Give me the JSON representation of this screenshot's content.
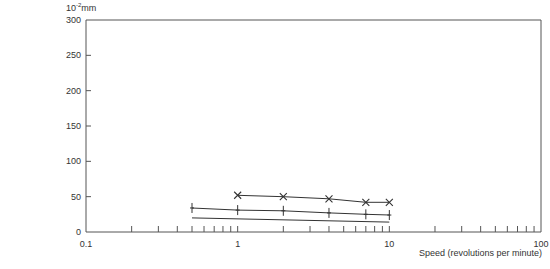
{
  "chart_data": {
    "type": "line",
    "title": "",
    "ylabel_unit": {
      "base": "10",
      "exp": "-2",
      "suffix": "mm"
    },
    "xlabel": "Speed (revolutions per minute)",
    "xscale": "log",
    "xlim": [
      0.1,
      100
    ],
    "ylim": [
      0,
      300
    ],
    "x_ticks": [
      0.1,
      1,
      10,
      100
    ],
    "x_tick_labels": [
      "0.1",
      "1",
      "10",
      "100"
    ],
    "y_ticks": [
      0,
      50,
      100,
      150,
      200,
      250,
      300
    ],
    "y_tick_labels": [
      "0",
      "50",
      "100",
      "150",
      "200",
      "250",
      "300"
    ],
    "grid": false,
    "legend": null,
    "series": [
      {
        "name": "cross-series",
        "marker": "x",
        "x": [
          1,
          2,
          4,
          7,
          10
        ],
        "y": [
          52,
          50,
          47,
          42,
          42
        ]
      },
      {
        "name": "plus-series",
        "marker": "+",
        "x": [
          0.5,
          1,
          2,
          4,
          7,
          10
        ],
        "y": [
          34,
          31,
          30,
          27,
          25,
          24
        ]
      },
      {
        "name": "line-series",
        "marker": "none",
        "x": [
          0.5,
          10
        ],
        "y": [
          20,
          14
        ]
      }
    ]
  },
  "labels": {
    "unit_base": "10",
    "unit_exp": "-2",
    "unit_suffix": "mm",
    "xlabel": "Speed (revolutions per minute)"
  },
  "colors": {
    "axis": "#555555",
    "line": "#333333",
    "text": "#333333"
  }
}
